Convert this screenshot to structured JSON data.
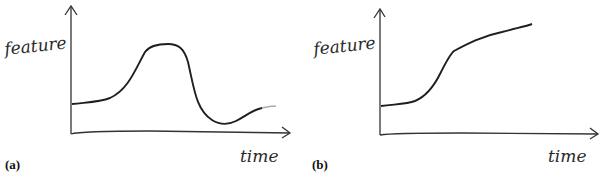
{
  "figure": {
    "panels": [
      {
        "id": "a",
        "label": "(a)",
        "y_axis_label": "feature",
        "x_axis_label": "time",
        "description": "Transient bump: baseline, rise to a peak plateau, fall below baseline, partial recovery"
      },
      {
        "id": "b",
        "label": "(b)",
        "y_axis_label": "feature",
        "x_axis_label": "time",
        "description": "Step-like persistent increase: baseline, sharp rise, continued slow increase"
      }
    ]
  },
  "colors": {
    "ink": "#2a2a2a",
    "background": "#ffffff"
  }
}
